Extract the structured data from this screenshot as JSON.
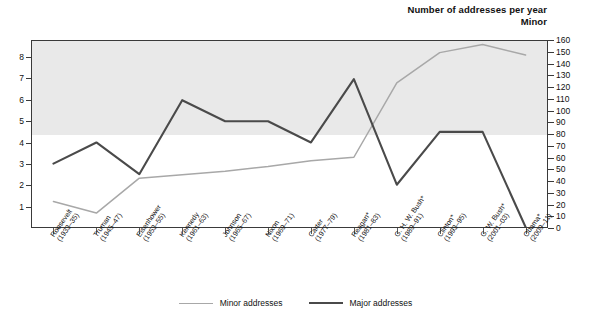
{
  "titles": {
    "right_line1": "Number of addresses per year",
    "right_line2": "Minor",
    "left_line1": "Number of addresses per year",
    "left_line2": "Major"
  },
  "legend": {
    "minor": "Minor addresses",
    "major": "Major addresses"
  },
  "colors": {
    "minor_line": "#a8a8a8",
    "major_line": "#4a4a4a",
    "band": "#e9e9e9",
    "frame": "#3a3a3a"
  },
  "chart_data": {
    "type": "line",
    "title": "Number of addresses per year",
    "xlabel": "",
    "ylabel": "Number of addresses per year",
    "grid": false,
    "legend_position": "bottom",
    "categories": [
      "Roosevelt\n(1933–35)",
      "Truman\n(1945–47)",
      "Eisenhower\n(1953–55)",
      "Kennedy\n(1961–63)",
      "Johnson\n(1965–67)",
      "Nixon\n(1969–71)",
      "Carter\n(1977–79)",
      "Reagan*\n(1981–83)",
      "G. H. W. Bush*\n(1989–91)",
      "Clinton*\n(1993–95)",
      "G. W. Bush*\n(2001–03)",
      "Obama*\n(2009–11)"
    ],
    "category_labels": [
      {
        "name": "Roosevelt",
        "years": "(1933–35)"
      },
      {
        "name": "Truman",
        "years": "(1945–47)"
      },
      {
        "name": "Eisenhower",
        "years": "(1953–55)"
      },
      {
        "name": "Kennedy",
        "years": "(1961–63)"
      },
      {
        "name": "Johnson",
        "years": "(1965–67)"
      },
      {
        "name": "Nixon",
        "years": "(1969–71)"
      },
      {
        "name": "Carter",
        "years": "(1977–79)"
      },
      {
        "name": "Reagan*",
        "years": "(1981–83)"
      },
      {
        "name": "G. H. W. Bush*",
        "years": "(1989–91)"
      },
      {
        "name": "Clinton*",
        "years": "(1993–95)"
      },
      {
        "name": "G. W. Bush*",
        "years": "(2001–03)"
      },
      {
        "name": "Obama*",
        "years": "(2009–11)"
      }
    ],
    "series": [
      {
        "name": "Minor addresses",
        "axis": "right",
        "color": "#a8a8a8",
        "values": [
          22,
          12,
          42,
          45,
          48,
          52,
          57,
          60,
          124,
          150,
          157,
          148
        ]
      },
      {
        "name": "Major addresses",
        "axis": "left",
        "color": "#4a4a4a",
        "values": [
          3,
          4,
          2.5,
          6,
          5,
          5,
          4,
          7,
          2,
          4.5,
          4.5,
          0
        ]
      }
    ],
    "axes": {
      "left": {
        "label": "Major",
        "ticks": [
          1,
          2,
          3,
          4,
          5,
          6,
          7,
          8
        ],
        "min": 0,
        "max": 8.8
      },
      "right": {
        "label": "Minor",
        "ticks": [
          0,
          10,
          20,
          30,
          40,
          50,
          60,
          70,
          80,
          90,
          100,
          110,
          120,
          130,
          140,
          150,
          160
        ],
        "min": 0,
        "max": 160
      }
    },
    "shaded_band": {
      "from": 80,
      "to": 160,
      "axis": "right"
    }
  }
}
